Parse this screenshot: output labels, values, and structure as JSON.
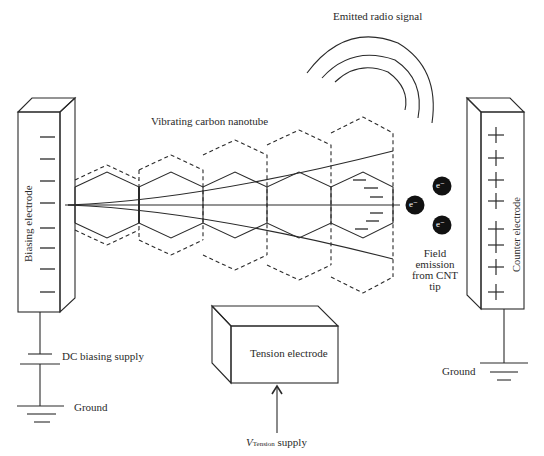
{
  "diagram": {
    "type": "schematic",
    "labels": {
      "emitted_signal": "Emitted radio signal",
      "nanotube": "Vibrating carbon nanotube",
      "biasing_electrode": "Biasing electrode",
      "counter_electrode": "Counter electrode",
      "dc_supply": "DC biasing supply",
      "ground_left": "Ground",
      "ground_right": "Ground",
      "tension_electrode": "Tension electrode",
      "v_tension_symbol": "V",
      "v_tension_subscript": "Tension",
      "v_tension_suffix": " supply",
      "field_emission": [
        "Field",
        "emission",
        "from CNT",
        "tip"
      ]
    },
    "electron_label": "e⁻",
    "charge_symbols": {
      "biasing_electrode": "−",
      "counter_electrode": "+",
      "nanotube_tip": "−"
    },
    "counts": {
      "biasing_minus_marks": 8,
      "counter_plus_marks": 8,
      "tip_minus_marks": 6,
      "electrons": 3,
      "radio_arcs": 3,
      "nanotube_segments": 5
    },
    "colors": {
      "stroke": "#2a2a2a",
      "electron_fill": "#111111",
      "electron_text": "#ffffff",
      "background": "#ffffff"
    }
  }
}
